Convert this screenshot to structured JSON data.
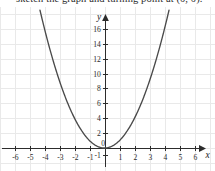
{
  "caption": {
    "text": "sketch the graph and turning point at (0, 0)."
  },
  "chart_data": {
    "type": "line",
    "title": "",
    "subtitle": "",
    "xlabel": "x",
    "ylabel": "y",
    "function": "y = x^2",
    "grid": true,
    "legend": null,
    "xlim": [
      -6.8,
      6.8
    ],
    "ylim": [
      -1.6,
      17.6
    ],
    "xticks": [
      -6,
      -5,
      -4,
      -3,
      -2,
      -1,
      0,
      1,
      2,
      3,
      4,
      5,
      6
    ],
    "xticklabels": [
      "-6",
      "-5",
      "-4",
      "-3",
      "-2",
      "-1",
      "0",
      "1",
      "2",
      "3",
      "4",
      "5",
      "6"
    ],
    "yticks": [
      -1,
      2,
      4,
      6,
      8,
      10,
      12,
      14,
      16
    ],
    "yticklabels": [
      "-1",
      "2",
      "4",
      "6",
      "8",
      "10",
      "12",
      "14",
      "16"
    ],
    "xtick_step": 1,
    "ytick_step": 2,
    "grid_x_step": 1,
    "grid_y_step": 2,
    "series": [
      {
        "name": "y = x^2",
        "color": "#4a4a4a",
        "x": [
          -4.3,
          -4.0,
          -3.7,
          -3.4,
          -3.1,
          -2.8,
          -2.5,
          -2.2,
          -1.9,
          -1.6,
          -1.3,
          -1.0,
          -0.7,
          -0.4,
          -0.1,
          0.0,
          0.1,
          0.4,
          0.7,
          1.0,
          1.3,
          1.6,
          1.9,
          2.2,
          2.5,
          2.8,
          3.1,
          3.4,
          3.7,
          4.0,
          4.3
        ],
        "y": [
          18.49,
          16.0,
          13.69,
          11.56,
          9.61,
          7.84,
          6.25,
          4.84,
          3.61,
          2.56,
          1.69,
          1.0,
          0.49,
          0.16,
          0.01,
          0.0,
          0.01,
          0.16,
          0.49,
          1.0,
          1.69,
          2.56,
          3.61,
          4.84,
          6.25,
          7.84,
          9.61,
          11.56,
          13.69,
          16.0,
          18.49
        ]
      }
    ],
    "vertex": {
      "x": 0,
      "y": 0,
      "label": "(0, 0)"
    },
    "colors": {
      "curve": "#4a4a4a",
      "axis": "#2c2c2c",
      "grid": "#e9e9e9",
      "text": "#2b2b2b",
      "background": "#ffffff"
    }
  },
  "axis_titles": {
    "x": "x",
    "y": "y"
  }
}
